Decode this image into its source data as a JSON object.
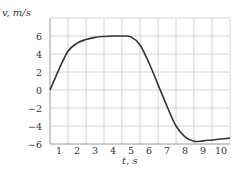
{
  "chart_data": {
    "type": "line",
    "title": "",
    "xlabel": "t, s",
    "ylabel": "v, m/s",
    "xlim": [
      0,
      10
    ],
    "ylim": [
      -6,
      8
    ],
    "xticks": [
      1,
      2,
      3,
      4,
      5,
      6,
      7,
      8,
      9,
      10
    ],
    "xtick_labels": [
      "1",
      "2",
      "3",
      "4",
      "5",
      "6",
      "7",
      "8",
      "9",
      "10"
    ],
    "yticks": [
      6,
      4,
      2,
      0,
      -2,
      -4,
      -6
    ],
    "ytick_labels": [
      "6",
      "4",
      "2",
      "0",
      "−2",
      "−4",
      "−6"
    ],
    "grid": true,
    "series": [
      {
        "name": "v(t)",
        "x": [
          0,
          0.5,
          1,
          1.5,
          2,
          2.5,
          3,
          3.5,
          4,
          4.5,
          5,
          5.5,
          6,
          6.5,
          7,
          7.5,
          8,
          8.5,
          9,
          9.5,
          10
        ],
        "y": [
          0,
          2.3,
          4.3,
          5.2,
          5.6,
          5.85,
          5.95,
          6,
          6,
          5.9,
          5,
          3,
          0.6,
          -1.8,
          -4,
          -5.2,
          -5.7,
          -5.65,
          -5.55,
          -5.45,
          -5.35
        ]
      }
    ]
  }
}
